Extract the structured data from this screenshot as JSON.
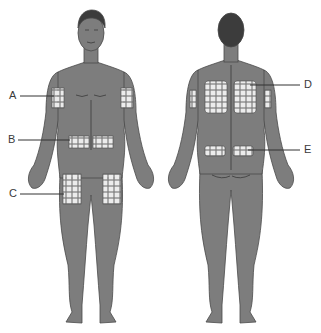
{
  "diagram": {
    "colors": {
      "body": "#7d7d7d",
      "outline": "#4a4a4a",
      "hair": "#3c3c3c",
      "site": "#ececec",
      "line": "#333333"
    },
    "figures": [
      {
        "view": "front"
      },
      {
        "view": "back"
      }
    ],
    "labels": [
      {
        "id": "A",
        "text": "A",
        "region": "upper arm (front)"
      },
      {
        "id": "B",
        "text": "B",
        "region": "abdomen"
      },
      {
        "id": "C",
        "text": "C",
        "region": "thigh"
      },
      {
        "id": "D",
        "text": "D",
        "region": "upper back / scapular"
      },
      {
        "id": "E",
        "text": "E",
        "region": "lower back / upper buttock"
      }
    ]
  }
}
